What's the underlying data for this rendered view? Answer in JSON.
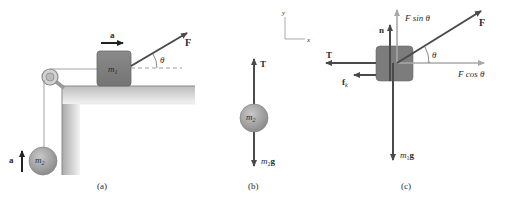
{
  "panels": {
    "a": {
      "caption": "(a)",
      "block_label": "m",
      "block_sub": "1",
      "ball_label": "m",
      "ball_sub": "2",
      "accel_label_top": "a",
      "accel_label_side": "a",
      "force_label": "F",
      "angle_label": "θ"
    },
    "b": {
      "caption": "(b)",
      "tension_label": "T",
      "ball_label": "m",
      "ball_sub": "2",
      "weight_label_m": "m",
      "weight_label_sub": "2",
      "weight_label_g": "g"
    },
    "c": {
      "caption": "(c)",
      "axis_y": "y",
      "axis_x": "x",
      "normal_label": "n",
      "tension_label": "T",
      "friction_label": "f",
      "friction_sub": "k",
      "force_label": "F",
      "fsin_label": "F sin  θ",
      "fcos_label": "F cos  θ",
      "angle_label": "θ",
      "weight_label_m": "m",
      "weight_label_sub": "1",
      "weight_label_g": "g"
    }
  },
  "colors": {
    "arrow_dark": "#4a4a4a",
    "arrow_light": "#a8a8a8",
    "block": "#7a7a7a",
    "ball": "#9a9a9a",
    "table": "#d8d8d8"
  }
}
